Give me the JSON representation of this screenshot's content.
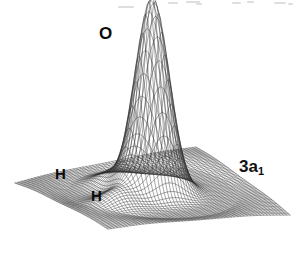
{
  "figure": {
    "kind": "3d-surface-mesh-plot",
    "background_color": "#ffffff",
    "mesh_color": "#1a1a1a",
    "label_color": "#0b0b0b"
  },
  "labels": {
    "oxygen": "O",
    "hydrogen_left": "H",
    "hydrogen_front": "H",
    "orbital_main": "3a",
    "orbital_subscript": "1",
    "orbital_full": "3a1"
  },
  "chart_data": {
    "type": "surface",
    "title": "",
    "subtitle": "",
    "xlabel": "",
    "ylabel": "",
    "zlabel": "",
    "grid": true,
    "legend_position": "none",
    "annotations": [
      {
        "text": "O",
        "x": 0.5,
        "y": 0.5,
        "z": 1.0,
        "note": "oxygen nucleus at tall central peak"
      },
      {
        "text": "H",
        "x": 0.26,
        "y": 0.62,
        "z": 0.1,
        "note": "hydrogen nucleus, left rear bump"
      },
      {
        "text": "H",
        "x": 0.4,
        "y": 0.3,
        "z": 0.1,
        "note": "hydrogen nucleus, front bump"
      },
      {
        "text": "3a1",
        "x": 0.88,
        "y": 0.68,
        "z": 0.0,
        "note": "orbital designation label on base plane"
      }
    ],
    "axis_ranges": {
      "x": [
        0,
        1
      ],
      "y": [
        0,
        1
      ],
      "z": [
        0,
        1
      ]
    },
    "peaks": [
      {
        "label": "O",
        "center_x": 0.5,
        "center_y": 0.5,
        "height": 1.0,
        "width": 0.085
      },
      {
        "label": "H",
        "center_x": 0.26,
        "center_y": 0.62,
        "height": 0.085,
        "width": 0.09
      },
      {
        "label": "H",
        "center_x": 0.4,
        "center_y": 0.3,
        "height": 0.075,
        "width": 0.09
      }
    ],
    "grid_lines": {
      "u": 56,
      "v": 56
    }
  },
  "scan_artifacts": {
    "present": true,
    "description": "faint light-gray flecks along the top margin from document scanning"
  }
}
